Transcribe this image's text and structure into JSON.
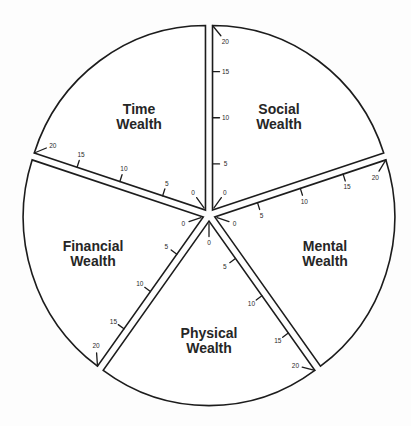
{
  "diagram": {
    "wedges": [
      {
        "id": "social",
        "label_line1": "Social",
        "label_line2": "Wealth"
      },
      {
        "id": "time",
        "label_line1": "Time",
        "label_line2": "Wealth"
      },
      {
        "id": "financial",
        "label_line1": "Financial",
        "label_line2": "Wealth"
      },
      {
        "id": "physical",
        "label_line1": "Physical",
        "label_line2": "Wealth"
      },
      {
        "id": "mental",
        "label_line1": "Mental",
        "label_line2": "Wealth"
      }
    ],
    "scale": {
      "min": 0,
      "max": 20,
      "ticks": [
        "0",
        "5",
        "10",
        "15",
        "20"
      ]
    }
  }
}
